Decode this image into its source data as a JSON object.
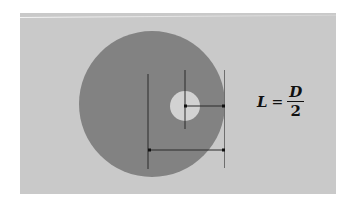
{
  "diagram": {
    "formula": {
      "lhs": "L",
      "equals": "=",
      "numerator": "D",
      "denominator": "2"
    },
    "colors": {
      "page_background": "#ffffff",
      "panel_background": "#c9c9c9",
      "disc_fill": "#828282",
      "hole_fill": "#d2d2d2",
      "line_color": "#2a2a2a",
      "text_color": "#111111"
    },
    "shapes": {
      "outer_disc": {
        "cx": 152,
        "cy": 104,
        "r": 73
      },
      "hole": {
        "cx": 185,
        "cy": 106,
        "r": 15
      },
      "left_vertical_line": {
        "x": 148,
        "y1": 74,
        "y2": 169
      },
      "center_vertical_line": {
        "x": 185,
        "y1": 70,
        "y2": 129
      },
      "right_vertical_line": {
        "x": 224,
        "y1": 70,
        "y2": 168
      },
      "upper_dimension_arrow": {
        "x1": 185,
        "x2": 224,
        "y": 106
      },
      "lower_dimension_arrow": {
        "x1": 148,
        "x2": 224,
        "y": 150
      }
    }
  }
}
